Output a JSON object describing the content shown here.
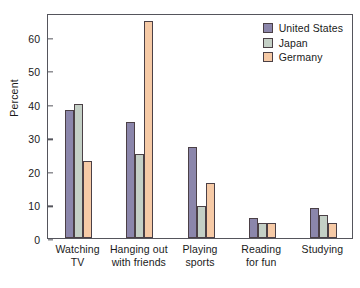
{
  "chart_data": {
    "type": "bar",
    "title": "",
    "xlabel": "",
    "ylabel": "Percent",
    "ylim": [
      0,
      67
    ],
    "yticks": [
      0,
      10,
      20,
      30,
      40,
      50,
      60
    ],
    "grid": false,
    "legend_position": "top-right",
    "categories": [
      "Watching TV",
      "Hanging out with friends",
      "Playing sports",
      "Reading for fun",
      "Studying"
    ],
    "category_lines": [
      [
        "Watching",
        "TV"
      ],
      [
        "Hanging out",
        "with friends"
      ],
      [
        "Playing",
        "sports"
      ],
      [
        "Reading",
        "for fun"
      ],
      [
        "Studying"
      ]
    ],
    "series": [
      {
        "name": "United States",
        "color": "#8b86ab",
        "values": [
          38,
          34.5,
          27,
          6,
          9
        ]
      },
      {
        "name": "Japan",
        "color": "#c4d0c6",
        "values": [
          40,
          25,
          9.5,
          4.5,
          7
        ]
      },
      {
        "name": "Germany",
        "color": "#f6caa6",
        "values": [
          23,
          64.5,
          16.5,
          4.5,
          4.5
        ]
      }
    ]
  }
}
